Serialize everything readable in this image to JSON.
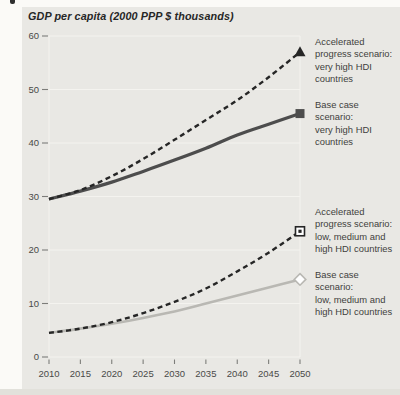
{
  "chart_data": {
    "type": "line",
    "title": "GDP per capita (2000 PPP $ thousands)",
    "x": [
      2010,
      2015,
      2020,
      2025,
      2030,
      2035,
      2040,
      2045,
      2050
    ],
    "xticks": [
      2010,
      2015,
      2020,
      2025,
      2030,
      2035,
      2040,
      2045,
      2050
    ],
    "yticks": [
      0,
      10,
      20,
      30,
      40,
      50,
      60
    ],
    "xlim": [
      2010,
      2050
    ],
    "ylim": [
      0,
      60
    ],
    "grid": "horizontal-light",
    "legend_position": "right",
    "series": [
      {
        "name": "Accelerated progress scenario: very high HDI countries",
        "style": "dashed",
        "color": "#262626",
        "marker": "triangle-filled",
        "width": 2.4,
        "values": [
          29.5,
          31.2,
          33.8,
          37,
          40.6,
          44.3,
          48,
          52.3,
          57
        ]
      },
      {
        "name": "Base case scenario: very high HDI countries",
        "style": "solid",
        "color": "#4d4d4d",
        "marker": "square-filled",
        "width": 3.2,
        "values": [
          29.5,
          31,
          32.7,
          34.7,
          36.8,
          39,
          41.5,
          43.5,
          45.5
        ]
      },
      {
        "name": "Accelerated progress scenario: low, medium and high HDI countries",
        "style": "dashed",
        "color": "#262626",
        "marker": "square-open-dot",
        "width": 2.4,
        "values": [
          4.5,
          5.3,
          6.5,
          8.2,
          10.3,
          12.8,
          16,
          19.5,
          23.5
        ]
      },
      {
        "name": "Base case scenario: low, medium and high HDI countries",
        "style": "solid",
        "color": "#b9b8b3",
        "marker": "diamond-open",
        "width": 2.6,
        "values": [
          4.5,
          5.3,
          6.2,
          7.3,
          8.5,
          10,
          11.5,
          13,
          14.5
        ]
      }
    ]
  },
  "legends": [
    {
      "text": "Accelerated\nprogress scenario:\nvery high HDI countries"
    },
    {
      "text": "Base case scenario:\nvery high HDI countries"
    },
    {
      "text": "Accelerated\nprogress scenario:\nlow, medium and\nhigh HDI countries"
    },
    {
      "text": "Base case scenario:\nlow, medium and\nhigh HDI countries"
    }
  ],
  "colors": {
    "page_bg": "#fbfaf7",
    "panel_bg": "#e9e8e4",
    "bottom_strip": "#e2e1db",
    "grid": "#f4f3ef",
    "tick": "#7d7d7a",
    "tick_text": "#4a4a48",
    "legend_text": "#3f3f3d",
    "title_text": "#262626"
  }
}
